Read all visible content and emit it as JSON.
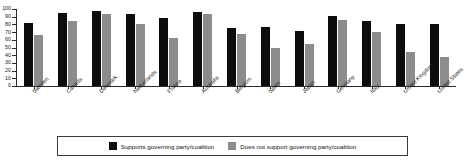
{
  "chart_data": {
    "type": "bar",
    "title": "",
    "xlabel": "",
    "ylabel": "",
    "ylim": [
      0,
      100
    ],
    "yticks": [
      0,
      10,
      20,
      30,
      40,
      50,
      60,
      70,
      80,
      90,
      100
    ],
    "grid": false,
    "legend_position": "bottom",
    "categories": [
      "Sweden",
      "Canada",
      "Denmark",
      "Netherlands",
      "France",
      "Australia",
      "Belgium",
      "Spain",
      "Japan",
      "Germany",
      "Italy",
      "United Kingdom",
      "United States"
    ],
    "series": [
      {
        "name": "Supports governing party/coalition",
        "color": "#0d0d0d",
        "values": [
          82,
          95,
          97,
          93,
          88,
          96,
          75,
          76,
          72,
          91,
          85,
          80,
          80
        ]
      },
      {
        "name": "Does not support governing party/coalition",
        "color": "#8c8c8c",
        "values": [
          66,
          85,
          93,
          80,
          63,
          94,
          68,
          49,
          55,
          86,
          70,
          44,
          38
        ]
      }
    ]
  },
  "legend": {
    "items": [
      {
        "label": "Supports governing party/coalition",
        "color": "#0d0d0d"
      },
      {
        "label": "Does not support governing party/coalition",
        "color": "#8c8c8c"
      }
    ]
  }
}
